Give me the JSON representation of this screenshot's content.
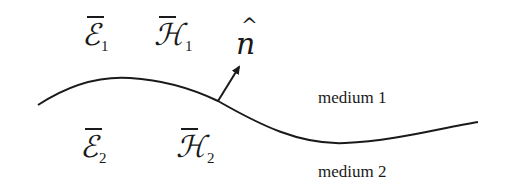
{
  "diagram": {
    "title": "",
    "symbols": {
      "e1": {
        "glyph": "ℰ",
        "subscript": "1"
      },
      "h1": {
        "glyph": "ℋ",
        "subscript": "1"
      },
      "e2": {
        "glyph": "ℰ",
        "subscript": "2"
      },
      "h2": {
        "glyph": "ℋ",
        "subscript": "2"
      },
      "normal": {
        "glyph": "n",
        "hat": "^"
      }
    },
    "regions": {
      "upper": "medium 1",
      "lower": "medium 2"
    },
    "colors": {
      "ink": "#1a1a1a",
      "background": "#ffffff"
    }
  }
}
